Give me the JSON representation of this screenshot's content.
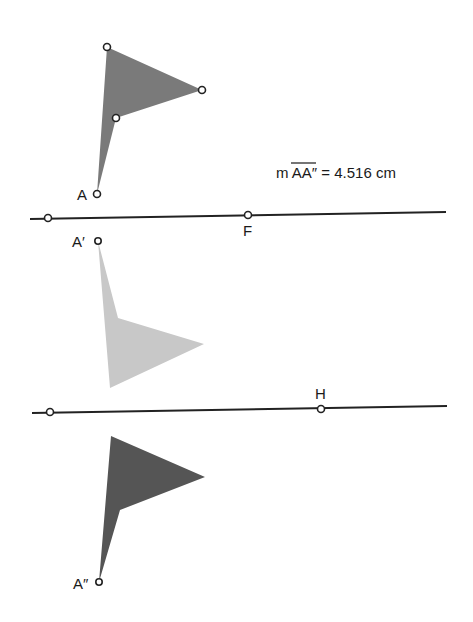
{
  "measurement": {
    "prefix": "m ",
    "segment": "AA″",
    "suffix": " = 4.516 cm"
  },
  "colors": {
    "original": "#7a7a7a",
    "first_image": "#c8c8c8",
    "second_image": "#555555",
    "line": "#222222"
  },
  "labels": {
    "A": "A",
    "A_prime": "A′",
    "A_double_prime": "A″",
    "F": "F",
    "H": "H"
  },
  "figures": {
    "original": {
      "points": "97,194 107,47 202,90 116,118"
    },
    "first_image": {
      "points": "98,241 118,318 204,344 110,388"
    },
    "second_image": {
      "points": "99,582 111,436 205,477 120,510"
    }
  },
  "lines": {
    "mirror_1": {
      "x1": 30,
      "y1": 219,
      "x2": 446,
      "y2": 212,
      "points": [
        {
          "x": 48,
          "y": 218
        },
        {
          "x": 248,
          "y": 215
        }
      ]
    },
    "mirror_2": {
      "x1": 32,
      "y1": 413,
      "x2": 447,
      "y2": 406,
      "points": [
        {
          "x": 50,
          "y": 412
        },
        {
          "x": 321,
          "y": 409
        }
      ]
    }
  }
}
